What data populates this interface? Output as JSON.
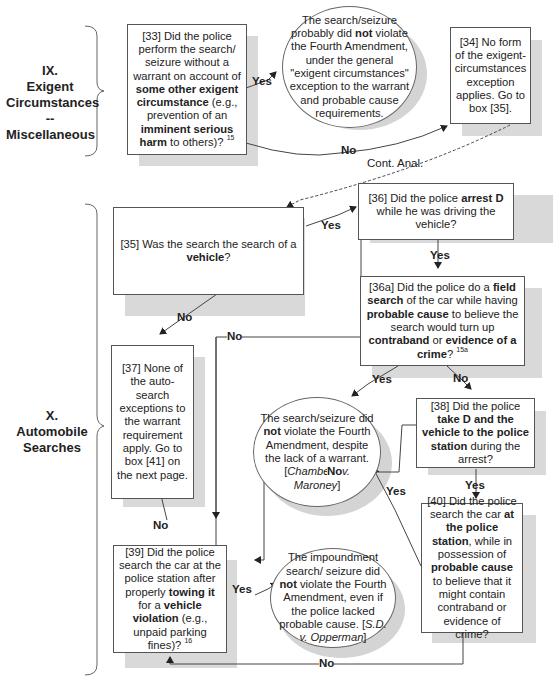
{
  "sections": [
    {
      "id": "IX",
      "label_number": "IX.",
      "label_line1": "Exigent",
      "label_line2": "Circumstances --",
      "label_line3": "Miscellaneous"
    },
    {
      "id": "X",
      "label_number": "X.",
      "label_line1": "Automobile",
      "label_line2": "Searches"
    }
  ],
  "nodes": {
    "n33": {
      "pre1": "[33] Did the police perform the search/ seizure without a warrant on account of ",
      "b1": "some other exigent circumstance",
      "mid1": " (e.g., prevention of an ",
      "b2": "imminent serious harm",
      "post": " to others)? ",
      "sup": "15"
    },
    "o33": {
      "pre": "The search/seizure probably did ",
      "b": "not",
      "post": " violate the Fourth Amendment, under the general \"exigent circumstances\" exception to the warrant and probable cause requirements."
    },
    "n34": {
      "text": "[34] No form of the exigent-circumstances exception applies. Go to box [35]."
    },
    "n35": {
      "pre": "[35] Was the search the search of a ",
      "b": "vehicle",
      "post": "?"
    },
    "n36": {
      "pre": "[36] Did the police ",
      "b": "arrest D",
      "post": " while he was driving the vehicle?"
    },
    "n36a": {
      "pre": "[36a] Did the police do a ",
      "b1": "field search",
      "mid1": " of the car while having ",
      "b2": "probable cause",
      "mid2": " to believe the search would turn up ",
      "b3": "contraband",
      "mid3": " or ",
      "b4": "evidence of a crime",
      "post": "? ",
      "sup": "15a"
    },
    "n37": {
      "text": "[37] None of the auto-search exceptions to the warrant requirement apply. Go to box [41] on the next page."
    },
    "oChambers": {
      "pre": "The search/seizure did ",
      "b": "not",
      "mid": " violate the Fourth Amendment, despite the lack of a warrant. [",
      "i": "Chambers v. Maroney",
      "post": "]"
    },
    "n38": {
      "pre": "[38] Did the police ",
      "b": "take D and the vehicle to the police station",
      "post": " during the arrest?"
    },
    "n39": {
      "pre": "[39] Did the police search the car at the police station after properly ",
      "b1": "towing it",
      "mid": " for a ",
      "b2": "vehicle violation",
      "post": " (e.g., unpaid parking fines)? ",
      "sup": "16"
    },
    "oOpperman": {
      "pre": "The impoundment search/ seizure did ",
      "b": "not",
      "mid": " violate the Fourth Amendment, even if the police lacked probable cause. [",
      "i": "S.D. v. Opperman",
      "post": "]"
    },
    "n40": {
      "pre": "[40] Did the police search the car ",
      "b1": "at the police station",
      "mid": ", while in possession of ",
      "b2": "probable cause",
      "post": " to believe that it might contain contraband or evidence of crime?"
    }
  },
  "edge_labels": {
    "yes": "Yes",
    "no": "No",
    "cont": "Cont. Anal."
  },
  "edges": [
    {
      "from": "n33",
      "to": "o33",
      "label": "Yes"
    },
    {
      "from": "n33",
      "to": "n34",
      "label": "No"
    },
    {
      "from": "n34",
      "to": "n35",
      "label": "Cont. Anal.",
      "style": "dashed"
    },
    {
      "from": "n35",
      "to": "n36",
      "label": "Yes"
    },
    {
      "from": "n35",
      "to": "n37",
      "label": "No"
    },
    {
      "from": "n36",
      "to": "n36a",
      "label": "Yes"
    },
    {
      "from": "n36",
      "to": "n39",
      "label": "No"
    },
    {
      "from": "n36a",
      "to": "oChambers",
      "label": "Yes"
    },
    {
      "from": "n36a",
      "to": "n38",
      "label": "No"
    },
    {
      "from": "n38",
      "to": "n40",
      "label": "Yes"
    },
    {
      "from": "n38",
      "to": "n39",
      "label": "No"
    },
    {
      "from": "n40",
      "to": "oChambers",
      "label": "Yes"
    },
    {
      "from": "n40",
      "to": "n39",
      "label": "No"
    },
    {
      "from": "n39",
      "to": "oOpperman",
      "label": "Yes"
    },
    {
      "from": "n39",
      "to": "n37",
      "label": "No"
    }
  ],
  "colors": {
    "border": "#555555",
    "shadow": "#d9d9d9",
    "text": "#222222"
  }
}
